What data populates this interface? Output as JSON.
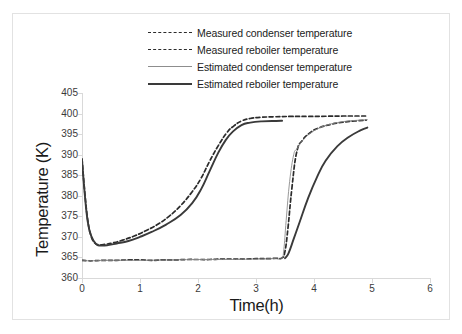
{
  "chart_data": {
    "type": "line",
    "title": "",
    "xlabel": "Time(h)",
    "ylabel": "Temperature (K)",
    "xlim": [
      0,
      6
    ],
    "ylim": [
      360,
      405
    ],
    "xticks": [
      0,
      1,
      2,
      3,
      4,
      5,
      6
    ],
    "yticks": [
      360,
      365,
      370,
      375,
      380,
      385,
      390,
      395,
      400,
      405
    ],
    "grid": false,
    "legend_position": "top-center",
    "series": [
      {
        "name": "Measured condenser temperature",
        "style": "dashed",
        "color": "#2b2b2b",
        "x": [
          0.0,
          0.1,
          0.2,
          0.4,
          0.6,
          0.8,
          1.0,
          1.2,
          1.4,
          1.6,
          1.8,
          2.0,
          2.2,
          2.4,
          2.6,
          2.8,
          3.0,
          3.2,
          3.35,
          3.45,
          3.5,
          3.55,
          3.62,
          3.7,
          3.8,
          3.95,
          4.1,
          4.3,
          4.5,
          4.7,
          4.9
        ],
        "y": [
          364.3,
          364.2,
          364.2,
          364.3,
          364.3,
          364.4,
          364.4,
          364.3,
          364.4,
          364.4,
          364.5,
          364.5,
          364.5,
          364.6,
          364.6,
          364.6,
          364.7,
          364.7,
          364.8,
          364.9,
          366.5,
          372.0,
          382.0,
          390.5,
          393.5,
          395.5,
          396.6,
          397.4,
          397.9,
          398.2,
          398.4
        ]
      },
      {
        "name": "Measured reboiler temperature",
        "style": "dashed",
        "color": "#2b2b2b",
        "x": [
          0.0,
          0.05,
          0.1,
          0.15,
          0.22,
          0.3,
          0.4,
          0.55,
          0.7,
          0.9,
          1.1,
          1.3,
          1.5,
          1.7,
          1.9,
          2.05,
          2.2,
          2.35,
          2.5,
          2.62,
          2.75,
          2.9,
          3.1,
          3.3,
          3.6,
          3.9,
          4.2,
          4.5,
          4.8,
          4.9
        ],
        "y": [
          389.0,
          380.5,
          374.0,
          370.5,
          368.5,
          368.1,
          368.2,
          368.6,
          369.2,
          370.2,
          371.5,
          373.0,
          375.0,
          377.6,
          381.0,
          384.2,
          388.4,
          392.2,
          395.4,
          397.0,
          398.2,
          398.8,
          399.1,
          399.2,
          399.3,
          399.3,
          399.35,
          399.4,
          399.4,
          399.4
        ]
      },
      {
        "name": "Estimated condenser temperature",
        "style": "solid-thin",
        "color": "#8d8d8d",
        "x": [
          0.0,
          0.2,
          0.5,
          1.0,
          1.5,
          2.0,
          2.5,
          3.0,
          3.3,
          3.44,
          3.48,
          3.52,
          3.58,
          3.65,
          3.7,
          3.78,
          3.9,
          4.05,
          4.2,
          4.4,
          4.6,
          4.8,
          4.92
        ],
        "y": [
          364.2,
          364.2,
          364.3,
          364.3,
          364.4,
          364.5,
          364.5,
          364.6,
          364.7,
          364.8,
          367.0,
          374.0,
          383.5,
          390.0,
          391.3,
          393.0,
          394.8,
          396.2,
          397.1,
          397.8,
          398.2,
          398.4,
          398.5
        ]
      },
      {
        "name": "Estimated reboiler temperature",
        "style": "solid-thick",
        "color": "#3a3a3a",
        "x": [
          0.0,
          0.05,
          0.1,
          0.16,
          0.24,
          0.32,
          0.45,
          0.6,
          0.8,
          1.0,
          1.2,
          1.45,
          1.7,
          1.9,
          2.05,
          2.2,
          2.35,
          2.48,
          2.6,
          2.75,
          2.9,
          3.1,
          3.35,
          3.45,
          3.5,
          3.56,
          3.65,
          3.75,
          3.9,
          4.05,
          4.2,
          4.4,
          4.6,
          4.8,
          4.92
        ],
        "y": [
          388.8,
          380.0,
          373.6,
          370.2,
          368.3,
          367.9,
          368.0,
          368.4,
          369.0,
          370.0,
          371.2,
          373.0,
          375.3,
          378.2,
          381.5,
          386.0,
          390.5,
          393.6,
          395.6,
          397.2,
          397.8,
          398.1,
          398.2,
          398.25,
          364.8,
          366.0,
          369.5,
          373.5,
          379.5,
          384.5,
          388.5,
          392.0,
          394.3,
          395.9,
          396.6
        ]
      }
    ],
    "series_note": "Estimated reboiler series includes both the upper reboiler trace and the lower condenser-rise trace drawn in the same thick dark stroke"
  },
  "legend": {
    "items": [
      {
        "label": "Measured condenser temperature",
        "style": "dashed"
      },
      {
        "label": "Measured reboiler temperature",
        "style": "dashed"
      },
      {
        "label": "Estimated condenser temperature",
        "style": "solid-thin"
      },
      {
        "label": "Estimated reboiler temperature",
        "style": "solid-thick"
      }
    ]
  },
  "axes": {
    "y_title": "Temperature (K)",
    "x_title": "Time(h)",
    "y_tick_labels": [
      "405",
      "400",
      "395",
      "390",
      "385",
      "380",
      "375",
      "370",
      "365",
      "360"
    ],
    "x_tick_labels": [
      "0",
      "1",
      "2",
      "3",
      "4",
      "5",
      "6"
    ]
  },
  "colors": {
    "measured": "#2b2b2b",
    "estimated_condenser": "#8d8d8d",
    "estimated_reboiler": "#3a3a3a",
    "axis": "#d9d9d9",
    "frame": "#e2e2e2",
    "background": "#ffffff"
  }
}
